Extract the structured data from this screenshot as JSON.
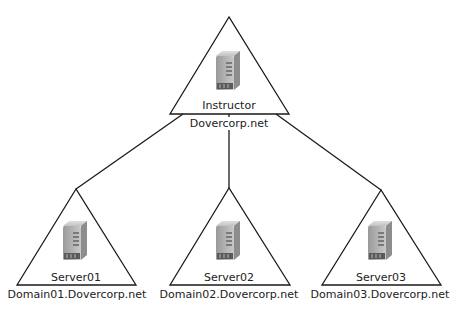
{
  "diagram": {
    "root": {
      "host": "Instructor",
      "domain": "Dovercorp.net",
      "icon": "server-icon"
    },
    "children": [
      {
        "host": "Server01",
        "domain": "Domain01.Dovercorp.net",
        "icon": "server-icon"
      },
      {
        "host": "Server02",
        "domain": "Domain02.Dovercorp.net",
        "icon": "server-icon"
      },
      {
        "host": "Server03",
        "domain": "Domain03.Dovercorp.net",
        "icon": "server-icon"
      }
    ],
    "colors": {
      "line": "#1a1a1a",
      "server_body": "#b8b8b8",
      "server_front": "#8f8f8f",
      "server_dark": "#5a5a5a"
    }
  }
}
